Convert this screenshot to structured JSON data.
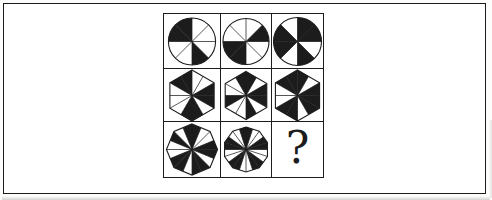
{
  "canvas": {
    "ink": "#1c1c1c",
    "paper": "#ffffff",
    "scan_shadow": "#c9c9c9"
  },
  "puzzle": {
    "description_hint": "3x3 figural matrix, sector wheels, missing ninth figure",
    "cells": [
      {
        "row": 0,
        "col": 0,
        "kind": "wheel",
        "shape": "circle",
        "sides": 0,
        "sectors": 8,
        "radius": 24,
        "black": [
          3,
          6,
          7
        ]
      },
      {
        "row": 0,
        "col": 1,
        "kind": "wheel",
        "shape": "circle",
        "sides": 0,
        "sectors": 8,
        "radius": 23.5,
        "black": [
          1,
          4,
          5
        ]
      },
      {
        "row": 0,
        "col": 2,
        "kind": "wheel",
        "shape": "circle",
        "sides": 0,
        "sectors": 8,
        "radius": 24,
        "black": [
          0,
          1,
          3,
          5,
          6
        ]
      },
      {
        "row": 1,
        "col": 0,
        "kind": "wheel",
        "shape": "polygon",
        "sides": 6,
        "sectors": 12,
        "radius": 26,
        "black": [
          2,
          3,
          5,
          6,
          10,
          11
        ]
      },
      {
        "row": 1,
        "col": 1,
        "kind": "wheel",
        "shape": "polygon",
        "sides": 6,
        "sectors": 12,
        "radius": 24.5,
        "black": [
          0,
          2,
          3,
          5,
          8,
          11
        ]
      },
      {
        "row": 1,
        "col": 2,
        "kind": "wheel",
        "shape": "polygon",
        "sides": 6,
        "sectors": 12,
        "radius": 25.5,
        "black": [
          0,
          2,
          3,
          4,
          6,
          7,
          10,
          11
        ]
      },
      {
        "row": 2,
        "col": 0,
        "kind": "wheel",
        "shape": "polygon",
        "sides": 8,
        "sectors": 16,
        "radius": 26,
        "black": [
          0,
          3,
          4,
          6,
          7,
          9,
          10,
          13,
          15
        ]
      },
      {
        "row": 2,
        "col": 1,
        "kind": "wheel",
        "shape": "polygon",
        "sides": 10,
        "sectors": 20,
        "radius": 23,
        "black": [
          0,
          3,
          4,
          7,
          8,
          11,
          12,
          15,
          16,
          19
        ]
      },
      {
        "row": 2,
        "col": 2,
        "kind": "question",
        "label": "?"
      }
    ]
  }
}
